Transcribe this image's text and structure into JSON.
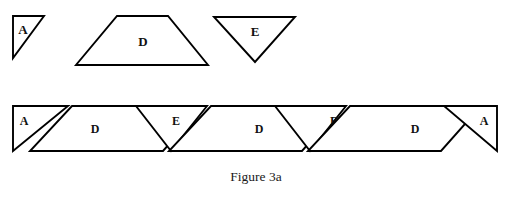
{
  "figure": {
    "caption": "Figure 3a",
    "caption_position": {
      "x": 256,
      "y": 176
    },
    "background_color": "#ffffff",
    "stroke_color": "#000000",
    "fill_color": "#ffffff",
    "label_color": "#111111"
  },
  "legend_row": {
    "description": "Three individual prototile shapes shown separately",
    "shapes": [
      {
        "id": "legend-shape-a",
        "label": "A",
        "kind": "right-triangle",
        "points": "13,16 44,16 13,58",
        "label_pos": {
          "x": 23,
          "y": 31
        }
      },
      {
        "id": "legend-shape-d",
        "label": "D",
        "kind": "trapezoid",
        "points": "117,16 168,16 208,65 76,65",
        "label_pos": {
          "x": 143,
          "y": 43
        }
      },
      {
        "id": "legend-shape-e",
        "label": "E",
        "kind": "inverted-triangle",
        "points": "214,17 295,17 255,62",
        "label_pos": {
          "x": 255,
          "y": 33
        }
      }
    ]
  },
  "tessellation_strip": {
    "description": "Prototiles tessellated into a horizontal band",
    "band_top": 105,
    "band_bottom": 152,
    "shapes": [
      {
        "id": "strip-shape-a-left",
        "label": "A",
        "kind": "right-triangle",
        "points": "13,106 68,106 13,151",
        "label_pos": {
          "x": 24,
          "y": 122
        }
      },
      {
        "id": "strip-shape-d-1",
        "label": "D",
        "kind": "trapezoid",
        "points": "72,106 203,106 163,151 30,151",
        "label_pos": {
          "x": 95,
          "y": 130
        }
      },
      {
        "id": "strip-shape-e-1",
        "label": "E",
        "kind": "inverted-triangle",
        "points": "136,106 207,106 171,151",
        "label_pos": {
          "x": 176,
          "y": 122
        }
      },
      {
        "id": "strip-shape-d-2",
        "label": "D",
        "kind": "trapezoid",
        "points": "211,106 342,106 302,151 169,151",
        "label_pos": {
          "x": 259,
          "y": 130
        }
      },
      {
        "id": "strip-shape-e-2",
        "label": "E",
        "kind": "inverted-triangle",
        "points": "275,106 346,106 310,151",
        "label_pos": {
          "x": 334,
          "y": 122
        }
      },
      {
        "id": "strip-shape-d-3",
        "label": "D",
        "kind": "trapezoid",
        "points": "350,106 481,106 441,151 308,151",
        "label_pos": {
          "x": 415,
          "y": 130
        }
      },
      {
        "id": "strip-shape-a-right",
        "label": "A",
        "kind": "right-triangle-mirrored",
        "points": "444,106 497,106 497,151",
        "label_pos": {
          "x": 484,
          "y": 122
        }
      }
    ]
  }
}
